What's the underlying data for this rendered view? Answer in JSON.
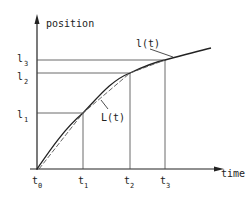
{
  "diagram": {
    "y_axis_label": "position",
    "x_axis_label": "time",
    "curve_labels": {
      "actual": "l(t)",
      "approx": "L(t)"
    },
    "x_ticks": [
      {
        "base": "t",
        "sub": "0"
      },
      {
        "base": "t",
        "sub": "1"
      },
      {
        "base": "t",
        "sub": "2"
      },
      {
        "base": "t",
        "sub": "3"
      }
    ],
    "y_ticks": [
      {
        "base": "l",
        "sub": "1"
      },
      {
        "base": "l",
        "sub": "2"
      },
      {
        "base": "l",
        "sub": "3"
      }
    ],
    "colors": {
      "line": "#222222",
      "background": "#ffffff"
    }
  }
}
